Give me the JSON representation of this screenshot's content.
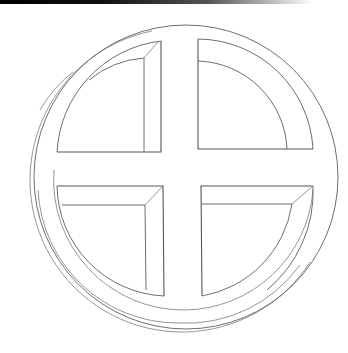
{
  "figure": {
    "colors": {
      "background": "#ffffff",
      "stroke": "#6e6e6e",
      "top_bar": "#000000"
    }
  }
}
